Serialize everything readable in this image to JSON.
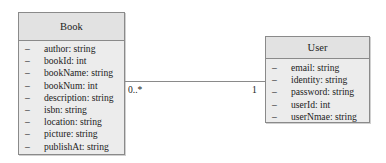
{
  "classes": {
    "book": {
      "name": "Book",
      "attributes": [
        {
          "vis": "–",
          "text": "author: string"
        },
        {
          "vis": "–",
          "text": "bookId: int"
        },
        {
          "vis": "–",
          "text": "bookName: string"
        },
        {
          "vis": "–",
          "text": "bookNum: int"
        },
        {
          "vis": "–",
          "text": "description: string"
        },
        {
          "vis": "–",
          "text": "isbn: string"
        },
        {
          "vis": "–",
          "text": "location: string"
        },
        {
          "vis": "–",
          "text": "picture: string"
        },
        {
          "vis": "–",
          "text": "publishAt: string"
        }
      ]
    },
    "user": {
      "name": "User",
      "attributes": [
        {
          "vis": "–",
          "text": "email: string"
        },
        {
          "vis": "–",
          "text": "identity: string"
        },
        {
          "vis": "–",
          "text": "password: string"
        },
        {
          "vis": "–",
          "text": "userId: int"
        },
        {
          "vis": "–",
          "text": "userNmae: string"
        }
      ]
    }
  },
  "association": {
    "book_multiplicity": "0..*",
    "user_multiplicity": "1"
  }
}
